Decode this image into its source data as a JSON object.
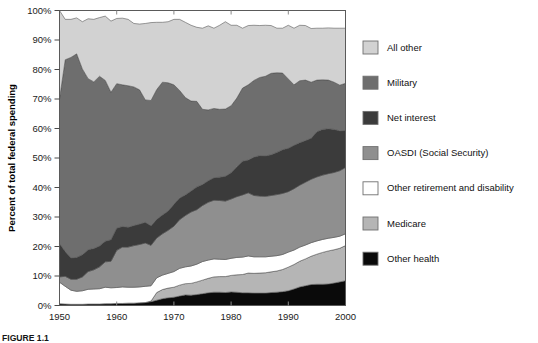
{
  "figure": {
    "caption": "FIGURE 1.1",
    "y_axis_label": "Percent of total federal spending",
    "x_axis_label": ""
  },
  "axes": {
    "y_ticks": [
      "0%",
      "10%",
      "20%",
      "30%",
      "40%",
      "50%",
      "60%",
      "70%",
      "80%",
      "90%",
      "100%"
    ],
    "y_tick_values": [
      0,
      10,
      20,
      30,
      40,
      50,
      60,
      70,
      80,
      90,
      100
    ],
    "x_ticks": [
      "1950",
      "1960",
      "1970",
      "1980",
      "1990",
      "2000"
    ],
    "x_tick_values": [
      1950,
      1960,
      1970,
      1980,
      1990,
      2000
    ],
    "ylim": [
      0,
      100
    ],
    "xlim": [
      1950,
      2000
    ]
  },
  "legend": {
    "position": "right",
    "items": [
      {
        "label": "All other",
        "color": "#d2d2d2",
        "key": "all_other"
      },
      {
        "label": "Military",
        "color": "#6e6e6e",
        "key": "military"
      },
      {
        "label": "Net interest",
        "color": "#3b3b3b",
        "key": "net_interest"
      },
      {
        "label": "OASDI (Social Security)",
        "color": "#8f8f8f",
        "key": "oasdi"
      },
      {
        "label": "Other retirement and disability",
        "color": "#ffffff",
        "key": "other_retirement"
      },
      {
        "label": "Medicare",
        "color": "#b5b5b5",
        "key": "medicare"
      },
      {
        "label": "Other health",
        "color": "#0a0a0a",
        "key": "other_health"
      }
    ]
  },
  "chart_data": {
    "type": "area",
    "stacked": true,
    "title": "",
    "xlabel": "",
    "ylabel": "Percent of total federal spending",
    "xlim": [
      1950,
      2000
    ],
    "ylim": [
      0,
      100
    ],
    "grid": false,
    "legend_position": "right",
    "x": [
      1950,
      1951,
      1952,
      1953,
      1954,
      1955,
      1956,
      1957,
      1958,
      1959,
      1960,
      1961,
      1962,
      1963,
      1964,
      1965,
      1966,
      1967,
      1968,
      1969,
      1970,
      1971,
      1972,
      1973,
      1974,
      1975,
      1976,
      1977,
      1978,
      1979,
      1980,
      1981,
      1982,
      1983,
      1984,
      1985,
      1986,
      1987,
      1988,
      1989,
      1990,
      1991,
      1992,
      1993,
      1994,
      1995,
      1996,
      1997,
      1998,
      1999,
      2000
    ],
    "stack_order_bottom_to_top": [
      "other_health",
      "medicare",
      "other_retirement",
      "oasdi",
      "net_interest",
      "military",
      "all_other"
    ],
    "series": [
      {
        "name": "Other health",
        "color": "#0a0a0a",
        "values": [
          0.6,
          0.5,
          0.4,
          0.4,
          0.4,
          0.5,
          0.5,
          0.5,
          0.6,
          0.6,
          0.7,
          0.7,
          0.8,
          0.8,
          0.9,
          1.0,
          1.3,
          1.8,
          2.3,
          2.6,
          2.8,
          3.2,
          3.6,
          3.5,
          3.7,
          4.0,
          4.3,
          4.5,
          4.5,
          4.4,
          4.6,
          4.5,
          4.3,
          4.3,
          4.2,
          4.2,
          4.2,
          4.4,
          4.5,
          4.7,
          5.0,
          5.6,
          6.3,
          6.7,
          7.1,
          7.2,
          7.2,
          7.3,
          7.6,
          8.0,
          8.4
        ]
      },
      {
        "name": "Medicare",
        "color": "#b5b5b5",
        "values": [
          0,
          0,
          0,
          0,
          0,
          0,
          0,
          0,
          0,
          0,
          0,
          0,
          0,
          0,
          0,
          0,
          0.2,
          2.6,
          3.1,
          3.3,
          3.4,
          3.7,
          3.8,
          4.0,
          4.3,
          4.6,
          4.9,
          5.2,
          5.3,
          5.4,
          5.6,
          5.9,
          6.2,
          6.7,
          6.7,
          6.8,
          6.9,
          7.0,
          7.2,
          7.5,
          8.0,
          8.3,
          8.7,
          9.1,
          9.6,
          10.2,
          10.8,
          11.2,
          11.3,
          11.4,
          11.9
        ]
      },
      {
        "name": "Other retirement and disability",
        "color": "#ffffff",
        "values": [
          7.3,
          6.0,
          4.8,
          4.4,
          4.6,
          5.0,
          5.1,
          5.2,
          5.6,
          5.4,
          5.4,
          5.6,
          5.4,
          5.4,
          5.4,
          5.5,
          5.2,
          5.0,
          4.9,
          5.0,
          5.3,
          5.7,
          5.7,
          5.9,
          6.0,
          6.3,
          6.2,
          6.1,
          5.9,
          5.8,
          5.8,
          5.9,
          5.9,
          5.8,
          5.6,
          5.5,
          5.4,
          5.3,
          5.2,
          5.1,
          5.1,
          4.9,
          4.8,
          4.7,
          4.6,
          4.5,
          4.4,
          4.3,
          4.2,
          4.1,
          4.0
        ]
      },
      {
        "name": "OASDI (Social Security)",
        "color": "#8f8f8f",
        "values": [
          1.8,
          3.4,
          3.7,
          4.1,
          4.7,
          6.0,
          6.5,
          7.4,
          8.6,
          9.0,
          12.6,
          13.5,
          13.6,
          14.1,
          14.4,
          14.7,
          13.7,
          13.5,
          14.0,
          14.6,
          15.4,
          16.5,
          17.4,
          18.3,
          18.5,
          19.0,
          19.6,
          19.9,
          19.9,
          19.8,
          20.1,
          20.6,
          21.1,
          21.4,
          20.8,
          20.6,
          20.5,
          20.6,
          20.7,
          20.7,
          20.5,
          20.8,
          21.0,
          21.3,
          21.5,
          21.7,
          21.8,
          21.9,
          22.0,
          22.2,
          22.5
        ]
      },
      {
        "name": "Net interest",
        "color": "#3b3b3b",
        "values": [
          11.3,
          8.4,
          7.2,
          7.4,
          7.5,
          7.4,
          7.2,
          7.1,
          7.0,
          7.3,
          7.5,
          7.0,
          6.7,
          6.8,
          6.9,
          7.0,
          6.6,
          6.3,
          6.4,
          6.5,
          7.4,
          7.3,
          7.0,
          7.1,
          7.7,
          7.1,
          7.3,
          7.6,
          7.9,
          8.4,
          8.9,
          10.1,
          11.4,
          11.1,
          13.0,
          13.7,
          13.7,
          13.8,
          14.3,
          14.8,
          14.7,
          14.7,
          14.4,
          14.1,
          13.9,
          15.3,
          15.5,
          15.2,
          14.6,
          13.5,
          12.5
        ]
      },
      {
        "name": "Military",
        "color": "#6e6e6e",
        "values": [
          49.0,
          65.0,
          68.0,
          69.0,
          63.0,
          58.0,
          56.5,
          57.5,
          54.5,
          50.0,
          49.0,
          48.0,
          48.0,
          47.0,
          45.5,
          41.5,
          42.5,
          44.0,
          45.0,
          43.5,
          40.5,
          36.5,
          33.0,
          30.5,
          29.0,
          25.5,
          24.0,
          23.5,
          23.0,
          22.8,
          22.7,
          23.3,
          24.8,
          25.5,
          26.0,
          26.5,
          27.0,
          27.6,
          27.0,
          26.0,
          23.5,
          20.5,
          21.0,
          20.5,
          19.0,
          17.5,
          16.8,
          16.5,
          16.0,
          15.5,
          16.0
        ]
      },
      {
        "name": "All other",
        "color": "#d2d2d2",
        "values": [
          30.0,
          13.7,
          12.9,
          12.2,
          16.0,
          20.3,
          21.2,
          19.9,
          21.8,
          24.1,
          22.1,
          22.6,
          22.5,
          21.5,
          22.3,
          25.9,
          26.4,
          22.8,
          20.3,
          20.7,
          22.2,
          24.1,
          25.5,
          25.7,
          25.1,
          27.5,
          28.5,
          27.2,
          28.5,
          29.6,
          27.3,
          24.7,
          20.3,
          20.1,
          18.7,
          17.6,
          17.3,
          16.2,
          15.1,
          15.2,
          18.2,
          19.2,
          18.8,
          18.5,
          18.2,
          17.6,
          17.5,
          17.7,
          18.3,
          19.3,
          18.7
        ]
      }
    ]
  }
}
